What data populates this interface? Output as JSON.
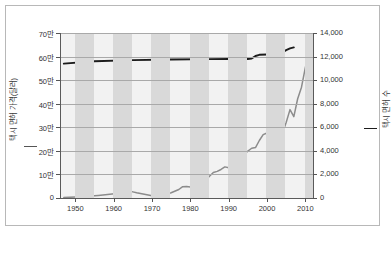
{
  "chart_data": {
    "type": "line",
    "title": "",
    "subtitle": "",
    "xlabel": "",
    "xlim": [
      1946,
      2012
    ],
    "x_ticks": [
      1950,
      1960,
      1970,
      1980,
      1990,
      2000,
      2010
    ],
    "x_tick_labels": [
      "1950",
      "1960",
      "1970",
      "1980",
      "1990",
      "2000",
      "2010"
    ],
    "grid": true,
    "legend_position": "axis-titles",
    "axes": [
      {
        "side": "left",
        "label": "택시 면허 가격(달러)",
        "ylim": [
          0,
          700000
        ],
        "ticks": [
          0,
          100000,
          200000,
          300000,
          400000,
          500000,
          600000,
          700000
        ],
        "tick_labels": [
          "0",
          "10만",
          "20만",
          "30만",
          "40만",
          "50만",
          "60만",
          "70만"
        ],
        "color": "#8c8c8c"
      },
      {
        "side": "right",
        "label": "택시 면허 수",
        "ylim": [
          0,
          14000
        ],
        "ticks": [
          0,
          2000,
          4000,
          6000,
          8000,
          10000,
          12000,
          14000
        ],
        "tick_labels": [
          "0",
          "2,000",
          "4,000",
          "6,000",
          "8,000",
          "10,000",
          "12,000",
          "14,000"
        ],
        "color": "#1c1c1c"
      }
    ],
    "series": [
      {
        "name": "택시 면허 가격(달러)",
        "axis": "left",
        "color": "#8c8c8c",
        "x": [
          1947,
          1950,
          1953,
          1956,
          1959,
          1962,
          1964,
          1965,
          1966,
          1968,
          1970,
          1971,
          1973,
          1975,
          1977,
          1978,
          1979,
          1980,
          1981,
          1982,
          1983,
          1984,
          1985,
          1986,
          1987,
          1988,
          1989,
          1990,
          1991,
          1992,
          1993,
          1994,
          1995,
          1996,
          1997,
          1998,
          1999,
          2000,
          2001,
          2002,
          2003,
          2004,
          2005,
          2006,
          2007,
          2008,
          2009,
          2010,
          2011
        ],
        "y": [
          2000,
          4000,
          7000,
          11000,
          16000,
          21000,
          30000,
          26000,
          22000,
          16000,
          10000,
          8000,
          14000,
          22000,
          36000,
          48000,
          49000,
          47000,
          45000,
          52000,
          63000,
          75000,
          92000,
          108000,
          113000,
          121000,
          132000,
          128000,
          125000,
          141000,
          162000,
          185000,
          199000,
          211000,
          214000,
          244000,
          269000,
          276000,
          254000,
          207000,
          238000,
          275000,
          320000,
          375000,
          345000,
          421000,
          470000,
          553000,
          620000
        ]
      },
      {
        "name": "택시 면허 수",
        "axis": "right",
        "color": "#1c1c1c",
        "x": [
          1947,
          1955,
          1965,
          1975,
          1985,
          1990,
          1995,
          1996,
          1997,
          1998,
          2000,
          2003,
          2004,
          2005,
          2006,
          2007
        ],
        "y": [
          11400,
          11600,
          11700,
          11750,
          11780,
          11790,
          11800,
          11830,
          12050,
          12150,
          12180,
          12200,
          12350,
          12550,
          12700,
          12780
        ]
      }
    ],
    "background_bands": {
      "color": "#d9d9d9",
      "base_color": "#f2f2f2",
      "note": "alternating vertical half-decade shading"
    }
  }
}
